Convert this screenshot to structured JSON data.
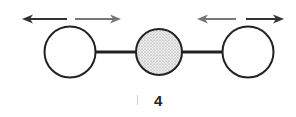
{
  "diagram": {
    "label": "4",
    "atoms": [
      {
        "name": "left-atom",
        "cx": 70,
        "cy": 52,
        "r": 26,
        "fill": "#ffffff"
      },
      {
        "name": "center-atom",
        "cx": 159,
        "cy": 52,
        "r": 23,
        "fill": "#d8d8d8",
        "pattern": "stippled"
      },
      {
        "name": "right-atom",
        "cx": 248,
        "cy": 52,
        "r": 26,
        "fill": "#ffffff"
      }
    ],
    "arrows": [
      {
        "name": "left-arrow-out",
        "direction": "left",
        "color": "#333333"
      },
      {
        "name": "left-arrow-in",
        "direction": "right",
        "color": "#777777"
      },
      {
        "name": "right-arrow-in",
        "direction": "left",
        "color": "#777777"
      },
      {
        "name": "right-arrow-out",
        "direction": "right",
        "color": "#333333"
      }
    ],
    "stroke_color": "#222222"
  }
}
